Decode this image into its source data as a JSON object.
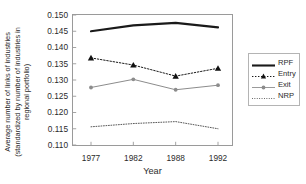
{
  "chart_data": {
    "type": "line",
    "title": "",
    "xlabel": "Year",
    "ylabel": "Average number of links of industries (standardized by number of industries in regional portfolio)",
    "ylabel_lines": [
      "Average number of links of industries",
      "(standardized by number of industries in",
      "regional portfolio)"
    ],
    "categories": [
      "1977",
      "1982",
      "1988",
      "1992"
    ],
    "x": [
      1977,
      1982,
      1988,
      1992
    ],
    "ylim": [
      0.11,
      0.15
    ],
    "ytick_labels": [
      "0.150",
      "0.145",
      "0.140",
      "0.135",
      "0.130",
      "0.125",
      "0.120",
      "0.115",
      "0.110"
    ],
    "ytick_values": [
      0.15,
      0.145,
      0.14,
      0.135,
      0.13,
      0.125,
      0.12,
      0.115,
      0.11
    ],
    "grid": false,
    "legend_position": "right",
    "series": [
      {
        "name": "RPF",
        "values": [
          0.145,
          0.1468,
          0.1476,
          0.1462
        ],
        "style": "solid-thick",
        "marker": "none",
        "color": "#1a1a1a"
      },
      {
        "name": "Entry",
        "values": [
          0.1368,
          0.1346,
          0.1312,
          0.1336
        ],
        "style": "dotted",
        "marker": "triangle",
        "color": "#1a1a1a"
      },
      {
        "name": "Exit",
        "values": [
          0.1277,
          0.1302,
          0.127,
          0.1284
        ],
        "style": "solid-thin",
        "marker": "circle",
        "color": "#8c8c8c"
      },
      {
        "name": "NRP",
        "values": [
          0.1156,
          0.1166,
          0.1172,
          0.115
        ],
        "style": "fine-dotted",
        "marker": "none",
        "color": "#5a5a5a"
      }
    ]
  },
  "legend": {
    "items": [
      {
        "label": "RPF"
      },
      {
        "label": "Entry"
      },
      {
        "label": "Exit"
      },
      {
        "label": "NRP"
      }
    ]
  }
}
